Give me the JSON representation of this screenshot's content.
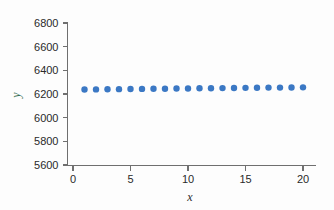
{
  "chart_data": {
    "type": "scatter",
    "title": "",
    "subtitle": "",
    "xlabel": "x",
    "ylabel": "y",
    "x": [
      1,
      2,
      3,
      4,
      5,
      6,
      7,
      8,
      9,
      10,
      11,
      12,
      13,
      14,
      15,
      16,
      17,
      18,
      19,
      20
    ],
    "values": [
      6238,
      6239,
      6240,
      6241,
      6242,
      6243,
      6244,
      6245,
      6246,
      6247,
      6248,
      6249,
      6250,
      6251,
      6252,
      6253,
      6254,
      6254,
      6255,
      6256
    ],
    "series": [
      {
        "name": "y",
        "values": [
          6238,
          6239,
          6240,
          6241,
          6242,
          6243,
          6244,
          6245,
          6246,
          6247,
          6248,
          6249,
          6250,
          6251,
          6252,
          6253,
          6254,
          6254,
          6255,
          6256
        ]
      }
    ],
    "xlim": [
      0,
      21
    ],
    "ylim": [
      5600,
      6800
    ],
    "xticks": [
      0,
      5,
      10,
      15,
      20
    ],
    "yticks": [
      5600,
      5800,
      6000,
      6200,
      6400,
      6600,
      6800
    ],
    "xtick_labels": [
      "0",
      "5",
      "10",
      "15",
      "20"
    ],
    "ytick_labels": [
      "5600",
      "5800",
      "6000",
      "6200",
      "6400",
      "6600",
      "6800"
    ],
    "grid": false,
    "legend": null,
    "legend_position": "none",
    "annotations": [],
    "marker": "circle",
    "marker_size": 3.2
  },
  "style": {
    "background": "#fdfdfd",
    "point_color": "#3b78c4",
    "axis_color": "#6f6f6f",
    "tick_label_color": "#2a2a2a",
    "ylabel_color": "#2f6b4f",
    "xlabel_color": "#2b2b2b"
  }
}
